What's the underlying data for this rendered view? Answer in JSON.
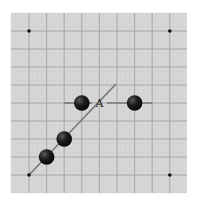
{
  "diagram": {
    "type": "go-board-fragment",
    "colors": {
      "page_background": "#ffffff",
      "board_background": "#d7d7d7",
      "grid_line": "#a3a3a3",
      "stone_black": "#111111",
      "stone_highlight": "#5a5a5a",
      "star_point": "#111111",
      "annotation_line": "#777777",
      "label": "#1a1a1a"
    },
    "board": {
      "x": 11,
      "y": 13,
      "width": 176,
      "height": 180
    },
    "grid": {
      "columns_x": [
        29,
        46.6,
        64.2,
        81.8,
        99.4,
        117,
        134.6,
        152.2,
        169.8
      ],
      "rows_y": [
        31,
        49,
        67,
        85,
        103,
        121,
        139,
        157,
        175
      ]
    },
    "star_points": [
      {
        "col": 0,
        "row": 0
      },
      {
        "col": 8,
        "row": 0
      },
      {
        "col": 0,
        "row": 8
      },
      {
        "col": 8,
        "row": 8
      }
    ],
    "stones": [
      {
        "color": "black",
        "col": 3,
        "row": 4
      },
      {
        "color": "black",
        "col": 6,
        "row": 4
      },
      {
        "color": "black",
        "col": 2,
        "row": 6
      },
      {
        "color": "black",
        "col": 1,
        "row": 7
      }
    ],
    "labels": [
      {
        "text": "A",
        "col": 4,
        "row": 4
      }
    ],
    "annotation_lines": [
      {
        "name": "diagonal-line",
        "x1": 29,
        "y1": 175,
        "x2": 116,
        "y2": 84
      },
      {
        "name": "horizontal-line-left",
        "x1": 64.2,
        "y1": 103,
        "x2": 92,
        "y2": 103
      },
      {
        "name": "horizontal-line-right",
        "x1": 107,
        "y1": 103,
        "x2": 152.2,
        "y2": 103
      }
    ]
  }
}
